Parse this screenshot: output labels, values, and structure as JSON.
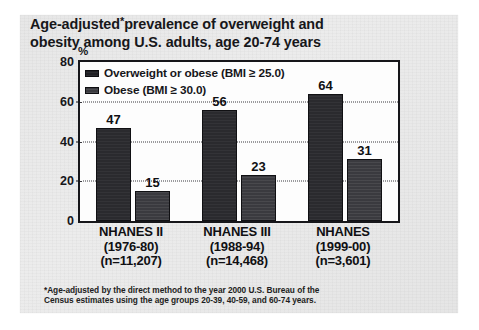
{
  "slide": {
    "title_line1": "Age-adjusted",
    "title_asterisk": "*",
    "title_line1b": "prevalence of overweight and",
    "title_line2": "obesity among U.S. adults, age 20-74 years",
    "footnote_line1": "*Age-adjusted by the direct method to the year 2000 U.S. Bureau of the",
    "footnote_line2": "Census estimates using the age groups 20-39, 40-59, and 60-74 years.",
    "background_color": "#e8e8e8",
    "ink_color": "#16161a"
  },
  "chart_data": {
    "type": "bar",
    "xlabel": "",
    "ylabel": "%",
    "ylim": [
      0,
      80
    ],
    "yticks": [
      0,
      20,
      40,
      60,
      80
    ],
    "ytick_labels": [
      "0",
      "20",
      "40",
      "60",
      "80"
    ],
    "grid": "horizontal-dotted-at-20-40-60",
    "legend_position": "inside-top-left",
    "categories": [
      "NHANES II (1976-80) (n=11,207)",
      "NHANES III (1988-94) (n=14,468)",
      "NHANES (1999-00) (n=3,601)"
    ],
    "category_lines": [
      [
        "NHANES II",
        "(1976-80)",
        "(n=11,207)"
      ],
      [
        "NHANES III",
        "(1988-94)",
        "(n=14,468)"
      ],
      [
        "NHANES",
        "(1999-00)",
        "(n=3,601)"
      ]
    ],
    "series": [
      {
        "name": "Overweight or obese (BMI ≥ 25.0)",
        "color": "#2a2a2e",
        "values": [
          47,
          56,
          64
        ],
        "value_labels": [
          "47",
          "56",
          "64"
        ]
      },
      {
        "name": "Obese (BMI ≥ 30.0)",
        "color": "#3a3a3f",
        "values": [
          15,
          23,
          31
        ],
        "value_labels": [
          "15",
          "23",
          "31"
        ]
      }
    ]
  }
}
